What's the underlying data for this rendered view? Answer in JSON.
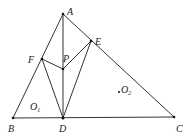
{
  "diagram": {
    "type": "geometry",
    "points": {
      "A": {
        "x": 63,
        "y": 14
      },
      "B": {
        "x": 13,
        "y": 118
      },
      "C": {
        "x": 174,
        "y": 117
      },
      "D": {
        "x": 63,
        "y": 118
      },
      "E": {
        "x": 91,
        "y": 41
      },
      "F": {
        "x": 42,
        "y": 59
      },
      "P": {
        "x": 63,
        "y": 69
      },
      "O2": {
        "x": 119,
        "y": 92
      }
    },
    "labels": {
      "A": "A",
      "B": "B",
      "C": "C",
      "D": "D",
      "E": "E",
      "F": "F",
      "P": "P",
      "O1_main": "O",
      "O1_sub": "1",
      "O2_main": "O",
      "O2_sub": "2"
    },
    "segments": [
      "AB",
      "BC",
      "CA",
      "AD",
      "FD",
      "ED",
      "FP",
      "EP"
    ],
    "line_color": "#333333"
  }
}
